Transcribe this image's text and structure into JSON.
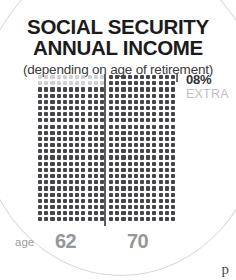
{
  "title": {
    "line1": "SOCIAL SECURITY",
    "line2": "ANNUAL INCOME",
    "subtitle": "(depending on age of retirement)"
  },
  "callout": {
    "percent": "08%",
    "label": "EXTRA"
  },
  "axis": {
    "age_label": "age",
    "age_left": "62",
    "age_right": "70"
  },
  "corner_glyph": "p",
  "colors": {
    "dot_dark": "#444548",
    "dot_light": "#cfd0d2",
    "divider": "#5a5b5e",
    "title": "#1b1b1b",
    "axis_value": "#95969a",
    "extra_label": "#bfc0c3",
    "arc": "#d8d8da",
    "background": "#ffffff"
  },
  "chart_data": {
    "type": "bar",
    "title": "SOCIAL SECURITY ANNUAL INCOME",
    "subtitle": "(depending on age of retirement)",
    "xlabel": "age",
    "ylabel": "",
    "categories": [
      "62",
      "70"
    ],
    "values": [
      242,
      264
    ],
    "unit": "dots",
    "dot_grid": {
      "columns": 11,
      "rows": 24,
      "left_filled_rows": 22,
      "left_light_rows": 2,
      "right_filled_rows": 24
    },
    "annotations": [
      "08% EXTRA"
    ],
    "legend": [],
    "grid": false
  }
}
